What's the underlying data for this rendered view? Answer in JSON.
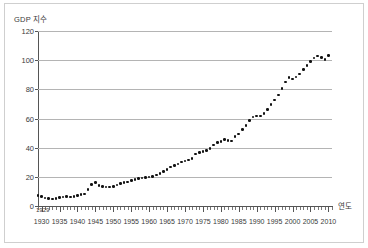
{
  "chart_data": {
    "type": "scatter",
    "title": "",
    "ylabel": "GDP 지수",
    "xlabel": "연도",
    "ylim": [
      0,
      120
    ],
    "xlim": [
      1929,
      2011
    ],
    "grid": true,
    "legend": false,
    "y_ticks": [
      0,
      20,
      40,
      60,
      80,
      100,
      120
    ],
    "x_tick_labels": [
      1930,
      1935,
      1940,
      1945,
      1950,
      1955,
      1960,
      1965,
      1970,
      1975,
      1980,
      1985,
      1990,
      1995,
      2000,
      2005,
      2010
    ],
    "x_axis_origin_label": "1929",
    "series": [
      {
        "name": "GDP 지수",
        "color": "#111111",
        "x": [
          1929,
          1930,
          1931,
          1932,
          1933,
          1934,
          1935,
          1936,
          1937,
          1938,
          1939,
          1940,
          1941,
          1942,
          1943,
          1944,
          1945,
          1946,
          1947,
          1948,
          1949,
          1950,
          1951,
          1952,
          1953,
          1954,
          1955,
          1956,
          1957,
          1958,
          1959,
          1960,
          1961,
          1962,
          1963,
          1964,
          1965,
          1966,
          1967,
          1968,
          1969,
          1970,
          1971,
          1972,
          1973,
          1974,
          1975,
          1976,
          1977,
          1978,
          1979,
          1980,
          1981,
          1982,
          1983,
          1984,
          1985,
          1986,
          1987,
          1988,
          1989,
          1990,
          1991,
          1992,
          1993,
          1994,
          1995,
          1996,
          1997,
          1998,
          1999,
          2000,
          2001,
          2002,
          2003,
          2004,
          2005,
          2006,
          2007,
          2008,
          2009,
          2010
        ],
        "y": [
          7.0,
          6.4,
          5.6,
          5.0,
          4.9,
          5.3,
          5.7,
          6.3,
          6.5,
          6.3,
          6.6,
          7.1,
          7.7,
          8.3,
          11.5,
          14.8,
          16.0,
          14.0,
          13.2,
          13.1,
          13.0,
          13.2,
          14.5,
          15.4,
          16.2,
          16.5,
          17.4,
          18.1,
          18.7,
          19.3,
          19.7,
          20.0,
          20.3,
          21.3,
          22.3,
          23.6,
          25.1,
          26.7,
          27.6,
          28.9,
          30.2,
          30.8,
          31.6,
          32.5,
          35.6,
          36.7,
          37.4,
          38.0,
          39.5,
          41.8,
          43.7,
          44.3,
          45.5,
          45.0,
          44.7,
          47.5,
          49.5,
          52.5,
          55.3,
          58.5,
          60.9,
          61.8,
          61.6,
          63.5,
          66.2,
          69.5,
          72.8,
          76.2,
          80.5,
          84.9,
          88.2,
          87.2,
          88.5,
          90.5,
          93.6,
          96.5,
          99.0,
          101.5,
          102.8,
          101.9,
          100.5,
          103.2
        ]
      }
    ]
  },
  "axis": {
    "y_title": "GDP 지수",
    "x_title": "연도",
    "origin_label": "1929"
  }
}
